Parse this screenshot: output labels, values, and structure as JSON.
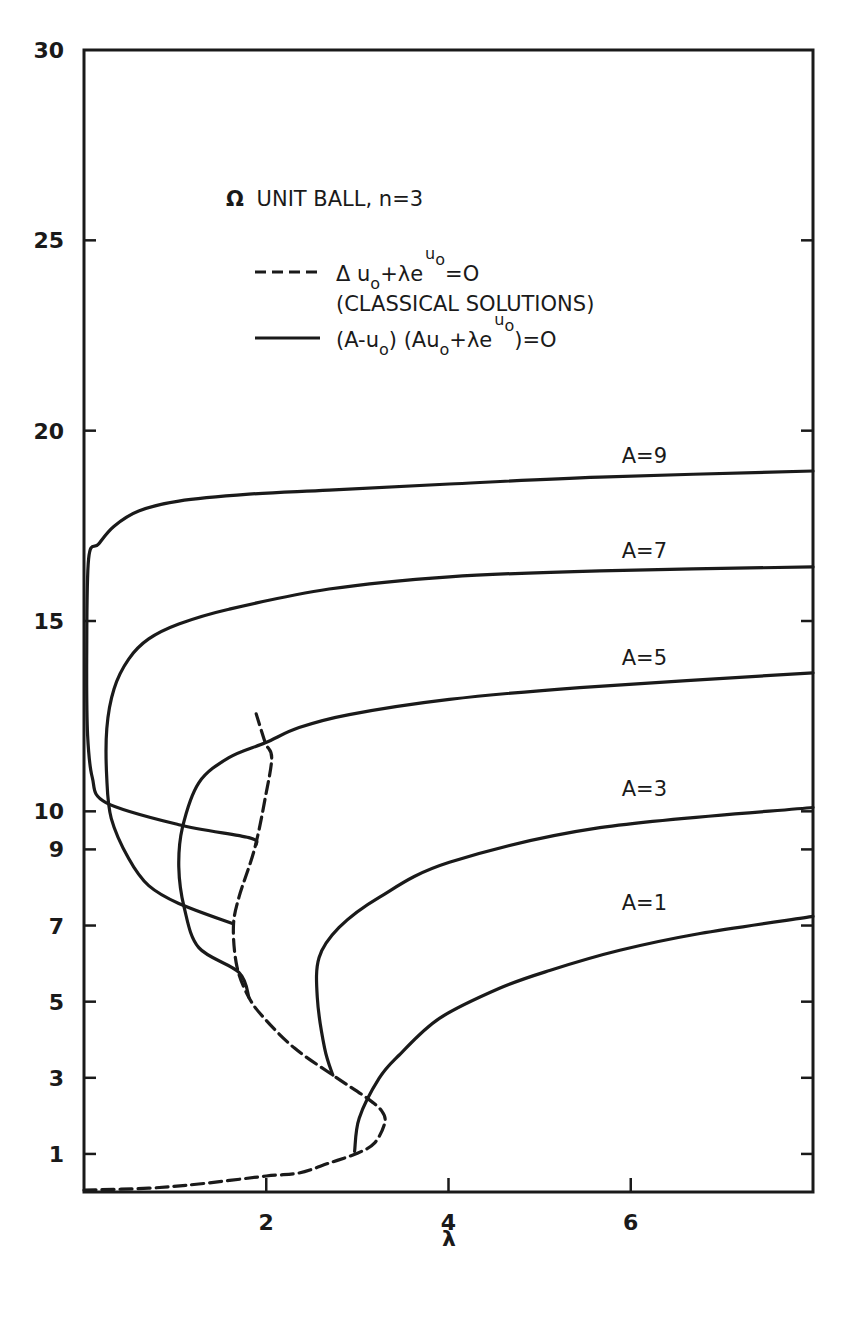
{
  "chart_data": {
    "type": "line",
    "title": "Ω UNIT BALL, n=3",
    "xlabel": "λ",
    "ylabel": "",
    "xlim": [
      0,
      8
    ],
    "ylim": [
      0,
      30
    ],
    "x_ticks": [
      2,
      4,
      6
    ],
    "x_tick_labels": [
      "2",
      "4",
      "6"
    ],
    "y_ticks": [
      1,
      3,
      5,
      7,
      9,
      10,
      15,
      20,
      25,
      30
    ],
    "y_tick_labels": [
      "1",
      "3",
      "5",
      "7",
      "9",
      "10",
      "15",
      "20",
      "25",
      "30"
    ],
    "grid": false,
    "legend": [
      {
        "style": "dashed",
        "label": "Δu₀+λe^u₀=0",
        "sublabel": "(CLASSICAL SOLUTIONS)"
      },
      {
        "style": "solid",
        "label": "(A-u₀)(Au₀+λe^u₀)=0"
      }
    ],
    "series": [
      {
        "name": "Classical solutions",
        "style": "dashed",
        "points": [
          [
            0.0,
            0.05
          ],
          [
            0.71,
            0.1
          ],
          [
            1.26,
            0.21
          ],
          [
            2.0,
            0.42
          ],
          [
            2.36,
            0.5
          ],
          [
            2.69,
            0.76
          ],
          [
            3.0,
            1.02
          ],
          [
            3.19,
            1.29
          ],
          [
            3.3,
            1.81
          ],
          [
            3.27,
            2.12
          ],
          [
            3.11,
            2.46
          ],
          [
            2.73,
            3.07
          ],
          [
            2.31,
            3.78
          ],
          [
            1.98,
            4.56
          ],
          [
            1.81,
            5.11
          ],
          [
            1.68,
            5.9
          ],
          [
            1.64,
            6.95
          ],
          [
            1.7,
            7.74
          ],
          [
            1.87,
            9.0
          ],
          [
            1.99,
            10.36
          ],
          [
            2.06,
            11.41
          ],
          [
            1.99,
            11.8
          ],
          [
            1.89,
            12.56
          ]
        ]
      },
      {
        "name": "A=9",
        "style": "solid",
        "label": "A=9",
        "points": [
          [
            1.89,
            9.13
          ],
          [
            1.81,
            9.31
          ],
          [
            1.04,
            9.65
          ],
          [
            0.24,
            10.23
          ],
          [
            0.09,
            10.9
          ],
          [
            0.04,
            12.0
          ],
          [
            0.03,
            14.0
          ],
          [
            0.05,
            16.63
          ],
          [
            0.16,
            17.02
          ],
          [
            0.33,
            17.49
          ],
          [
            0.6,
            17.89
          ],
          [
            1.04,
            18.15
          ],
          [
            1.81,
            18.33
          ],
          [
            2.69,
            18.44
          ],
          [
            4.01,
            18.6
          ],
          [
            5.66,
            18.78
          ],
          [
            8.0,
            18.94
          ]
        ],
        "label_pos": [
          6.15,
          19.05
        ]
      },
      {
        "name": "A=7",
        "style": "solid",
        "label": "A=7",
        "points": [
          [
            1.63,
            7.05
          ],
          [
            1.04,
            7.58
          ],
          [
            0.71,
            8.05
          ],
          [
            0.49,
            8.76
          ],
          [
            0.3,
            9.81
          ],
          [
            0.25,
            10.86
          ],
          [
            0.25,
            12.17
          ],
          [
            0.33,
            13.22
          ],
          [
            0.49,
            14.0
          ],
          [
            0.71,
            14.53
          ],
          [
            1.04,
            14.92
          ],
          [
            1.59,
            15.31
          ],
          [
            2.69,
            15.84
          ],
          [
            4.01,
            16.16
          ],
          [
            5.66,
            16.32
          ],
          [
            8.0,
            16.42
          ]
        ],
        "label_pos": [
          6.15,
          16.55
        ]
      },
      {
        "name": "A=5",
        "style": "solid",
        "label": "A=5",
        "points": [
          [
            1.81,
            5.11
          ],
          [
            1.7,
            5.77
          ],
          [
            1.26,
            6.42
          ],
          [
            1.1,
            7.47
          ],
          [
            1.04,
            8.53
          ],
          [
            1.08,
            9.57
          ],
          [
            1.26,
            10.75
          ],
          [
            1.59,
            11.41
          ],
          [
            1.99,
            11.8
          ],
          [
            2.36,
            12.2
          ],
          [
            2.91,
            12.54
          ],
          [
            4.01,
            12.94
          ],
          [
            5.44,
            13.25
          ],
          [
            8.0,
            13.64
          ]
        ],
        "label_pos": [
          6.15,
          13.75
        ]
      },
      {
        "name": "A=3",
        "style": "solid",
        "label": "A=3",
        "points": [
          [
            2.73,
            3.07
          ],
          [
            2.64,
            3.78
          ],
          [
            2.56,
            5.11
          ],
          [
            2.58,
            6.16
          ],
          [
            2.8,
            6.95
          ],
          [
            3.24,
            7.74
          ],
          [
            4.01,
            8.66
          ],
          [
            5.66,
            9.57
          ],
          [
            8.0,
            10.1
          ]
        ],
        "label_pos": [
          6.15,
          10.3
        ]
      },
      {
        "name": "A=1",
        "style": "solid",
        "label": "A=1",
        "points": [
          [
            2.97,
            1.07
          ],
          [
            3.02,
            1.94
          ],
          [
            3.24,
            2.99
          ],
          [
            3.46,
            3.6
          ],
          [
            3.9,
            4.56
          ],
          [
            4.56,
            5.35
          ],
          [
            5.11,
            5.82
          ],
          [
            5.88,
            6.35
          ],
          [
            6.76,
            6.79
          ],
          [
            8.0,
            7.24
          ]
        ],
        "label_pos": [
          6.15,
          7.3
        ]
      }
    ]
  },
  "legend": {
    "title_symbol": "Ω",
    "title_text": "UNIT BALL, n=3",
    "dashed_swatch": "----",
    "dashed_eq_main": "Δ u",
    "dashed_eq_sub": "o",
    "dashed_eq_rest": "+λe",
    "dashed_eq_sup": "u",
    "dashed_eq_supsub": "o",
    "dashed_eq_end": "=O",
    "dashed_note": "(CLASSICAL SOLUTIONS)",
    "solid_eq_a": "(A-u",
    "solid_eq_a_sub": "o",
    "solid_eq_b": ") (Au",
    "solid_eq_b_sub": "o",
    "solid_eq_c": "+λe",
    "solid_eq_sup": "u",
    "solid_eq_supsub": "o",
    "solid_eq_end": ")=O"
  },
  "axes": {
    "x_label": "λ"
  },
  "style": {
    "ink": "#1a1a1a",
    "background": "#ffffff"
  }
}
